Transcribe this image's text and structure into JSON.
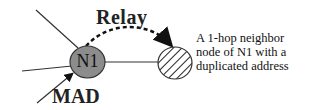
{
  "diagram": {
    "nodes": [
      {
        "id": "N1",
        "label": "N1",
        "style": "gray-filled-ellipse",
        "fill": "#8c8c8c"
      },
      {
        "id": "neighbor",
        "label": "",
        "style": "hatched-circle"
      }
    ],
    "edges": [
      {
        "from": "N1",
        "to": "neighbor",
        "style": "dashed-arc-arrow",
        "label": "Relay"
      },
      {
        "from": "external",
        "to": "N1",
        "style": "solid-arrow",
        "label": "MAD"
      }
    ],
    "labels": {
      "relay": "Relay",
      "mad": "MAD",
      "n1": "N1",
      "description_lines": [
        "A 1-hop neighbor",
        "node of N1 with a",
        "duplicated address"
      ]
    }
  }
}
